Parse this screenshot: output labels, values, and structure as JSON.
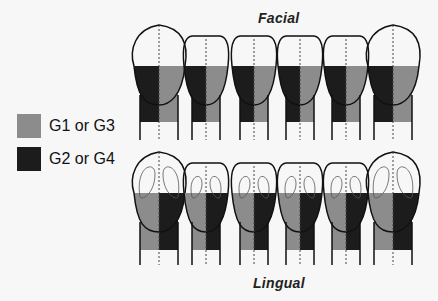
{
  "labels": {
    "top": "Facial",
    "bottom": "Lingual"
  },
  "legend": [
    {
      "label": "G1 or G3",
      "color": "#8c8c8c"
    },
    {
      "label": "G2 or G4",
      "color": "#1c1c1c"
    }
  ],
  "colors": {
    "light": "#8c8c8c",
    "dark": "#1c1c1c",
    "outline": "#111111",
    "background": "#f7f7f7"
  },
  "facial_teeth": [
    {
      "id": 1,
      "left": "dark",
      "right": "light"
    },
    {
      "id": 2,
      "left": "dark",
      "right": "light"
    },
    {
      "id": 3,
      "left": "dark",
      "right": "light"
    },
    {
      "id": 4,
      "left": "dark",
      "right": "light"
    },
    {
      "id": 5,
      "left": "dark",
      "right": "light"
    },
    {
      "id": 6,
      "left": "dark",
      "right": "light"
    }
  ],
  "lingual_teeth": [
    {
      "id": 1,
      "left": "light",
      "right": "dark"
    },
    {
      "id": 2,
      "left": "light",
      "right": "dark"
    },
    {
      "id": 3,
      "left": "light",
      "right": "dark"
    },
    {
      "id": 4,
      "left": "light",
      "right": "dark"
    },
    {
      "id": 5,
      "left": "light",
      "right": "dark"
    },
    {
      "id": 6,
      "left": "light",
      "right": "dark"
    }
  ]
}
